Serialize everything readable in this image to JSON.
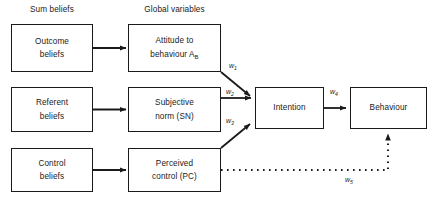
{
  "diagram": {
    "headers": {
      "sum_beliefs": "Sum beliefs",
      "global_variables": "Global variables"
    },
    "nodes": {
      "outcome_beliefs": {
        "line1": "Outcome",
        "line2": "beliefs"
      },
      "referent_beliefs": {
        "line1": "Referent",
        "line2": "beliefs"
      },
      "control_beliefs": {
        "line1": "Control",
        "line2": "beliefs"
      },
      "attitude": {
        "line1": "Attitude to",
        "line2": "behaviour A",
        "sub2": "B"
      },
      "subjective_norm": {
        "line1": "Subjective",
        "line2": "norm (SN)"
      },
      "perceived_control": {
        "line1": "Perceived",
        "line2": "control (PC)"
      },
      "intention": {
        "line1": "Intention"
      },
      "behaviour": {
        "line1": "Behaviour"
      }
    },
    "weights": {
      "w1": {
        "symbol": "w",
        "sub": "1"
      },
      "w2": {
        "symbol": "w",
        "sub": "2"
      },
      "w3": {
        "symbol": "w",
        "sub": "3"
      },
      "w4": {
        "symbol": "w",
        "sub": "4"
      },
      "w5": {
        "symbol": "w",
        "sub": "5"
      }
    },
    "colors": {
      "stroke": "#1a1a1a",
      "background": "#ffffff",
      "text": "#1a1a1a"
    }
  }
}
